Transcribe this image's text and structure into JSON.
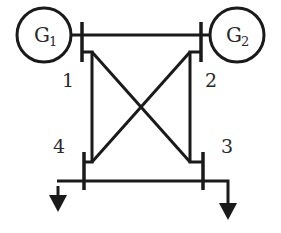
{
  "diagram": {
    "type": "power-system-one-line",
    "generators": [
      {
        "id": "G1",
        "letter": "G",
        "subscript": "1",
        "bus": "1"
      },
      {
        "id": "G2",
        "letter": "G",
        "subscript": "2",
        "bus": "2"
      }
    ],
    "buses": [
      {
        "id": "1",
        "label": "1"
      },
      {
        "id": "2",
        "label": "2"
      },
      {
        "id": "3",
        "label": "3"
      },
      {
        "id": "4",
        "label": "4"
      }
    ],
    "lines": [
      {
        "from": "1",
        "to": "2"
      },
      {
        "from": "1",
        "to": "4"
      },
      {
        "from": "1",
        "to": "3"
      },
      {
        "from": "2",
        "to": "3"
      },
      {
        "from": "2",
        "to": "4"
      },
      {
        "from": "4",
        "to": "3"
      }
    ],
    "loads": [
      {
        "bus": "4",
        "symbol": "down-arrow"
      },
      {
        "bus": "3",
        "symbol": "down-arrow"
      }
    ],
    "colors": {
      "stroke": "#1a1a1a",
      "background": "#ffffff"
    }
  }
}
